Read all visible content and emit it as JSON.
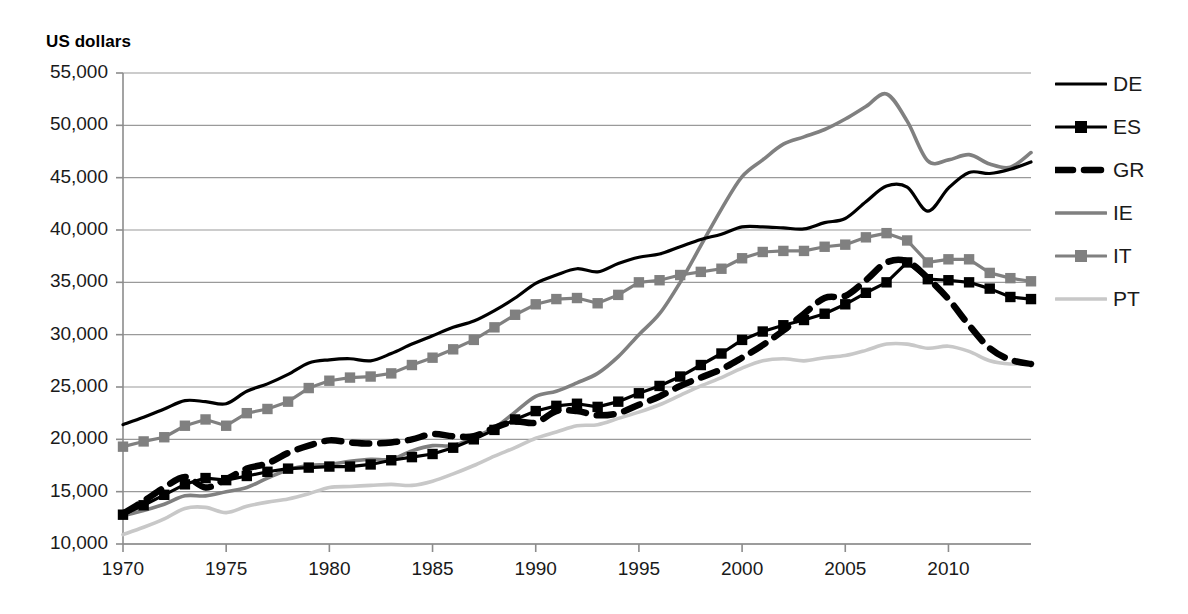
{
  "chart_data": {
    "type": "line",
    "title": "",
    "subtitle": "",
    "ylabel": "US dollars",
    "xlabel": "",
    "ylim": [
      10000,
      55000
    ],
    "xlim": [
      1970,
      2014
    ],
    "ytick_step": 5000,
    "yticks": [
      "10,000",
      "15,000",
      "20,000",
      "25,000",
      "30,000",
      "35,000",
      "40,000",
      "45,000",
      "50,000",
      "55,000"
    ],
    "ytick_values": [
      10000,
      15000,
      20000,
      25000,
      30000,
      35000,
      40000,
      45000,
      50000,
      55000
    ],
    "xticks": [
      "1970",
      "1975",
      "1980",
      "1985",
      "1990",
      "1995",
      "2000",
      "2005",
      "2010"
    ],
    "xtick_values": [
      1970,
      1975,
      1980,
      1985,
      1990,
      1995,
      2000,
      2005,
      2010
    ],
    "grid": "horizontal",
    "legend_position": "right",
    "x": [
      1970,
      1971,
      1972,
      1973,
      1974,
      1975,
      1976,
      1977,
      1978,
      1979,
      1980,
      1981,
      1982,
      1983,
      1984,
      1985,
      1986,
      1987,
      1988,
      1989,
      1990,
      1991,
      1992,
      1993,
      1994,
      1995,
      1996,
      1997,
      1998,
      1999,
      2000,
      2001,
      2002,
      2003,
      2004,
      2005,
      2006,
      2007,
      2008,
      2009,
      2010,
      2011,
      2012,
      2013,
      2014
    ],
    "series": [
      {
        "name": "DE",
        "color": "#000000",
        "style": "solid",
        "marker": "none",
        "width": 3.2,
        "values": [
          21400,
          22100,
          22900,
          23700,
          23600,
          23400,
          24600,
          25300,
          26200,
          27300,
          27600,
          27700,
          27500,
          28200,
          29100,
          29900,
          30700,
          31300,
          32300,
          33500,
          34900,
          35700,
          36300,
          36000,
          36800,
          37400,
          37700,
          38400,
          39100,
          39600,
          40300,
          40300,
          40200,
          40100,
          40700,
          41100,
          42700,
          44200,
          44100,
          41800,
          44000,
          45500,
          45400,
          45800,
          46500
        ]
      },
      {
        "name": "ES",
        "color": "#000000",
        "style": "solid",
        "marker": "square",
        "width": 3.2,
        "values": [
          12800,
          13700,
          14700,
          15700,
          16300,
          16100,
          16500,
          16900,
          17200,
          17300,
          17400,
          17400,
          17600,
          18000,
          18300,
          18600,
          19200,
          20000,
          20900,
          21900,
          22700,
          23200,
          23400,
          23100,
          23600,
          24400,
          25100,
          26000,
          27100,
          28200,
          29500,
          30300,
          30900,
          31400,
          32000,
          32900,
          34000,
          35000,
          36900,
          35300,
          35200,
          35000,
          34400,
          33600,
          33400
        ]
      },
      {
        "name": "GR",
        "color": "#000000",
        "style": "dashed",
        "marker": "none",
        "width": 6.5,
        "values": [
          12900,
          14100,
          15400,
          16400,
          15400,
          16200,
          17200,
          17700,
          18700,
          19400,
          19900,
          19700,
          19600,
          19700,
          20000,
          20500,
          20300,
          20300,
          21100,
          21700,
          21600,
          22700,
          22700,
          22300,
          22500,
          23300,
          24100,
          25100,
          25900,
          26700,
          27800,
          29000,
          30400,
          32000,
          33500,
          33700,
          35200,
          36900,
          37000,
          35400,
          33400,
          30900,
          28700,
          27600,
          27200
        ]
      },
      {
        "name": "IE",
        "color": "#808080",
        "style": "solid",
        "marker": "none",
        "width": 3.6,
        "values": [
          12700,
          13200,
          13800,
          14600,
          14600,
          15000,
          15400,
          16300,
          17100,
          17500,
          17600,
          17900,
          18100,
          18100,
          18900,
          19400,
          19400,
          20200,
          21100,
          22600,
          24100,
          24600,
          25400,
          26300,
          27900,
          30000,
          32000,
          35000,
          38500,
          42000,
          45100,
          46700,
          48200,
          48900,
          49600,
          50600,
          51800,
          53000,
          50400,
          46600,
          46700,
          47200,
          46300,
          46000,
          47400
        ]
      },
      {
        "name": "IT",
        "color": "#808080",
        "style": "solid",
        "marker": "square",
        "width": 3.2,
        "values": [
          19300,
          19800,
          20200,
          21300,
          21900,
          21300,
          22500,
          22900,
          23600,
          24900,
          25600,
          25900,
          26000,
          26300,
          27100,
          27800,
          28600,
          29500,
          30700,
          31900,
          32900,
          33400,
          33500,
          33000,
          33800,
          35000,
          35200,
          35700,
          36000,
          36300,
          37300,
          37900,
          38000,
          38000,
          38400,
          38600,
          39300,
          39700,
          39000,
          36900,
          37200,
          37200,
          35900,
          35400,
          35100
        ]
      },
      {
        "name": "PT",
        "color": "#c8c8c8",
        "style": "solid",
        "marker": "none",
        "width": 3.6,
        "values": [
          10900,
          11600,
          12400,
          13400,
          13500,
          13000,
          13600,
          14000,
          14300,
          14800,
          15400,
          15500,
          15600,
          15700,
          15600,
          16000,
          16700,
          17500,
          18400,
          19200,
          20100,
          20700,
          21300,
          21400,
          22000,
          22600,
          23300,
          24200,
          25100,
          25900,
          26800,
          27500,
          27700,
          27500,
          27800,
          28000,
          28500,
          29100,
          29100,
          28700,
          28900,
          28400,
          27500,
          27200,
          27300
        ]
      }
    ]
  },
  "legend": {
    "items": [
      {
        "label": "DE"
      },
      {
        "label": "ES"
      },
      {
        "label": "GR"
      },
      {
        "label": "IE"
      },
      {
        "label": "IT"
      },
      {
        "label": "PT"
      }
    ]
  },
  "colors": {
    "black": "#000000",
    "gray": "#808080",
    "light_gray": "#c8c8c8",
    "grid": "#9a9a9a",
    "axis": "#8c8c8c"
  }
}
